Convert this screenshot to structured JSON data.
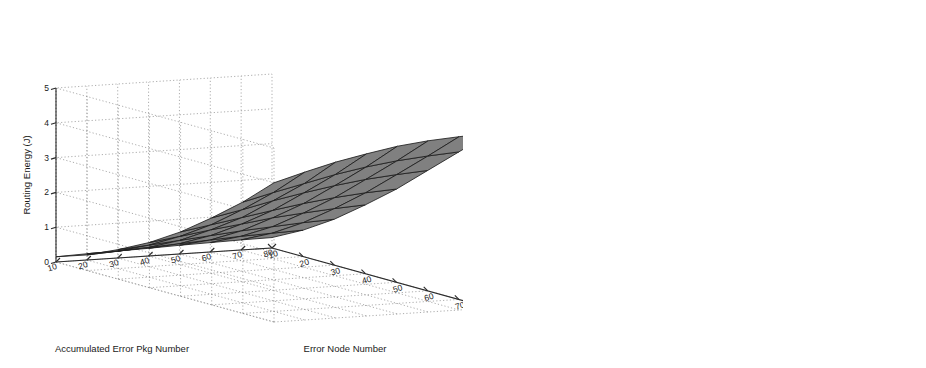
{
  "figure": {
    "background": "#ffffff",
    "panel_count": 2
  },
  "chart_data": [
    {
      "id": "left",
      "type": "surface3d",
      "title": "",
      "xlabel": "Error Node Number",
      "ylabel": "Accumulated Error Pkg Number",
      "zlabel": "Routing Energy (J)",
      "x_ticks": [
        10,
        20,
        30,
        40,
        50,
        60,
        70,
        80
      ],
      "y_ticks": [
        10,
        20,
        30,
        40,
        50,
        60,
        70,
        80
      ],
      "z_ticks": [
        0,
        1,
        2,
        3,
        4,
        5
      ],
      "xlim": [
        10,
        80
      ],
      "ylim": [
        10,
        80
      ],
      "zlim": [
        0,
        5
      ],
      "grid": true,
      "legend": "none",
      "series": [
        {
          "name": "Routing Energy",
          "color": "#808080",
          "edge_color": "#1f1f1f",
          "z": [
            [
              0.15,
              0.45,
              0.85,
              1.3,
              1.85,
              2.5,
              3.2,
              4.0
            ],
            [
              0.18,
              0.5,
              0.92,
              1.42,
              2.0,
              2.68,
              3.42,
              4.25
            ],
            [
              0.2,
              0.55,
              1.0,
              1.55,
              2.15,
              2.88,
              3.62,
              4.48
            ],
            [
              0.22,
              0.6,
              1.08,
              1.66,
              2.3,
              3.05,
              3.82,
              4.66
            ],
            [
              0.25,
              0.65,
              1.16,
              1.78,
              2.44,
              3.2,
              3.98,
              4.82
            ],
            [
              0.27,
              0.7,
              1.22,
              1.86,
              2.55,
              3.32,
              4.1,
              4.92
            ],
            [
              0.29,
              0.73,
              1.28,
              1.93,
              2.63,
              3.4,
              4.18,
              4.98
            ],
            [
              0.3,
              0.76,
              1.32,
              1.98,
              2.68,
              3.46,
              4.24,
              5.02
            ]
          ]
        }
      ]
    },
    {
      "id": "right",
      "type": "surface3d",
      "title": "",
      "xlabel": "Error Node Number",
      "ylabel": "Accumulated Error Pkg Number",
      "zlabel": "Transmitted Error Pkg Number Per Node",
      "x_ticks": [
        10,
        20,
        30,
        40,
        50,
        60,
        70,
        80
      ],
      "y_ticks": [
        10,
        20,
        30,
        40,
        50,
        60,
        70,
        80
      ],
      "z_ticks": [
        10,
        20,
        30,
        40,
        50,
        60
      ],
      "xlim": [
        10,
        80
      ],
      "ylim": [
        10,
        80
      ],
      "zlim": [
        10,
        60
      ],
      "grid": true,
      "legend": "annotations",
      "annotations": [
        {
          "text": "Base COOL",
          "target_series": "Base COOL"
        },
        {
          "text": "HI-COOL",
          "target_series": "HI-COOL"
        }
      ],
      "series": [
        {
          "name": "Base COOL",
          "color": "#7d7d7d",
          "edge_color": "#1f1f1f",
          "z": [
            [
              29.5,
              28.8,
              28.2,
              27.6,
              27.0,
              26.4,
              25.8,
              25.2
            ],
            [
              29.2,
              28.4,
              27.7,
              27.0,
              26.3,
              25.7,
              25.1,
              24.5
            ],
            [
              28.9,
              28.0,
              27.2,
              26.5,
              25.8,
              25.1,
              24.5,
              23.9
            ],
            [
              28.6,
              27.6,
              26.8,
              26.0,
              25.2,
              24.5,
              23.9,
              23.3
            ],
            [
              28.3,
              27.2,
              26.3,
              25.4,
              24.6,
              23.9,
              23.2,
              22.6
            ],
            [
              28.0,
              26.8,
              25.8,
              24.9,
              24.0,
              23.2,
              22.5,
              21.9
            ],
            [
              27.8,
              26.5,
              25.4,
              24.4,
              23.5,
              22.7,
              21.9,
              21.3
            ],
            [
              27.6,
              26.2,
              25.0,
              24.0,
              23.0,
              22.2,
              21.4,
              20.8
            ]
          ]
        },
        {
          "name": "HI-COOL",
          "color": "#d2d2d2",
          "edge_color": "#1f1f1f",
          "z": [
            [
              17.5,
              17.0,
              16.5,
              16.0,
              15.6,
              15.2,
              14.8,
              14.4
            ],
            [
              17.2,
              16.6,
              16.0,
              15.5,
              15.0,
              14.6,
              14.2,
              13.8
            ],
            [
              16.9,
              16.2,
              15.6,
              15.0,
              14.5,
              14.0,
              13.6,
              13.2
            ],
            [
              16.6,
              15.9,
              15.2,
              14.5,
              13.9,
              13.4,
              13.0,
              12.6
            ],
            [
              16.4,
              15.6,
              14.8,
              14.1,
              13.5,
              12.9,
              12.5,
              12.1
            ],
            [
              16.2,
              15.3,
              14.5,
              13.7,
              13.0,
              12.5,
              12.0,
              11.6
            ],
            [
              16.0,
              15.0,
              14.2,
              13.4,
              12.7,
              12.1,
              11.6,
              11.2
            ],
            [
              15.8,
              14.8,
              13.9,
              13.1,
              12.4,
              11.8,
              11.3,
              10.9
            ]
          ]
        }
      ]
    }
  ]
}
